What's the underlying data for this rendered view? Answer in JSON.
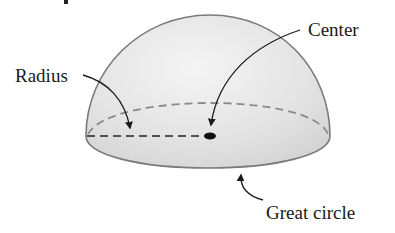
{
  "figure": {
    "labels": {
      "radius": "Radius",
      "center": "Center",
      "great_circle": "Great circle"
    },
    "colors": {
      "fill": "#e4e4e4",
      "outline": "#7a7a7a",
      "dashed_back": "#8a8a8a",
      "radius_line": "#222222",
      "text": "#1a1a1a"
    }
  }
}
